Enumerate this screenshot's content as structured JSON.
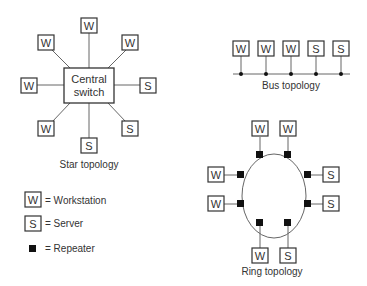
{
  "star": {
    "title": "Star topology",
    "center_line1": "Central",
    "center_line2": "switch",
    "nodes": [
      "W",
      "W",
      "W",
      "W",
      "S",
      "S",
      "W",
      "S"
    ]
  },
  "bus": {
    "title": "Bus topology",
    "nodes": [
      "W",
      "W",
      "W",
      "S",
      "S"
    ]
  },
  "ring": {
    "title": "Ring topology",
    "nodes": [
      "W",
      "W",
      "S",
      "S",
      "S",
      "W",
      "W",
      "W"
    ]
  },
  "legend": {
    "workstation_symbol": "W",
    "workstation_label": "= Workstation",
    "server_symbol": "S",
    "server_label": "= Server",
    "repeater_label": "= Repeater"
  },
  "colors": {
    "line": "#555555",
    "box": "#333333",
    "repeater": "#111111"
  }
}
